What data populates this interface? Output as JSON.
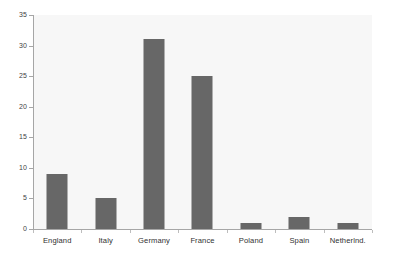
{
  "chart_data": {
    "type": "bar",
    "title": "",
    "subtitle": "",
    "xlabel": "",
    "ylabel": "",
    "categories": [
      "England",
      "Italy",
      "Germany",
      "France",
      "Poland",
      "Spain",
      "Netherlnd."
    ],
    "values": [
      9,
      5,
      31,
      25,
      1,
      2,
      1
    ],
    "series": [
      {
        "name": "",
        "values": [
          9,
          5,
          31,
          25,
          1,
          2,
          1
        ]
      }
    ],
    "ylim": [
      0,
      35
    ],
    "yticks": [
      0,
      5,
      10,
      15,
      20,
      25,
      30,
      35
    ],
    "ytick_labels": [
      "0",
      "5",
      "10",
      "15",
      "20",
      "25",
      "30",
      "35"
    ],
    "grid": false,
    "legend": false,
    "legend_position": "none",
    "annotations": [],
    "colors": {
      "bar": "#676767",
      "plot_background": "#f7f7f7",
      "figure_background": "#ffffff",
      "axis_line": "#a6a6a6",
      "tick_label": "#3f3f3f",
      "category_label": "#303030"
    }
  }
}
